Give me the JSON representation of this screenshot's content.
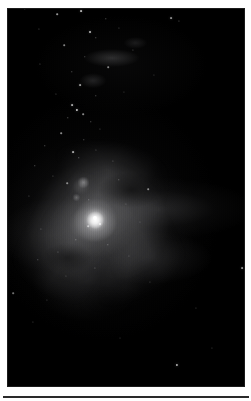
{
  "page": {
    "background_color": "#ffffff",
    "width": 251,
    "height": 401
  },
  "figure": {
    "name": "orion-nebula-plate",
    "kind": "astronomical-photograph",
    "rendering": "monochrome grayscale halftone",
    "background_color": "#000000",
    "frame": {
      "x": 8,
      "y": 9,
      "width": 236,
      "height": 377
    },
    "caption": "",
    "label": ""
  },
  "features": [
    {
      "name": "huygens-core",
      "label": "",
      "x_pct": 37,
      "y_pct": 56,
      "brightness": "peak"
    },
    {
      "name": "m43-loop",
      "label": "",
      "x_pct": 31,
      "y_pct": 47,
      "brightness": "bright"
    },
    {
      "name": "east-wing",
      "label": "",
      "x_pct": 64,
      "y_pct": 53,
      "brightness": "faint"
    },
    {
      "name": "west-wing",
      "label": "",
      "x_pct": 18,
      "y_pct": 60,
      "brightness": "faint"
    },
    {
      "name": "ngc1977-wisp",
      "label": "",
      "x_pct": 46,
      "y_pct": 13,
      "brightness": "faint"
    },
    {
      "name": "southern-skirt",
      "label": "",
      "x_pct": 34,
      "y_pct": 72,
      "brightness": "faint"
    }
  ],
  "stars": [
    {
      "x": 25,
      "y": 9,
      "r": 0.7,
      "o": 0.55
    },
    {
      "x": 57,
      "y": 14,
      "r": 0.8,
      "o": 0.6
    },
    {
      "x": 81,
      "y": 11,
      "r": 0.9,
      "o": 0.7
    },
    {
      "x": 106,
      "y": 19,
      "r": 0.7,
      "o": 0.45
    },
    {
      "x": 171,
      "y": 18,
      "r": 0.9,
      "o": 0.55
    },
    {
      "x": 179,
      "y": 21,
      "r": 0.6,
      "o": 0.4
    },
    {
      "x": 39,
      "y": 29,
      "r": 0.6,
      "o": 0.35
    },
    {
      "x": 90,
      "y": 32,
      "r": 1.0,
      "o": 0.75
    },
    {
      "x": 96,
      "y": 38,
      "r": 0.7,
      "o": 0.45
    },
    {
      "x": 119,
      "y": 28,
      "r": 0.6,
      "o": 0.35
    },
    {
      "x": 64,
      "y": 45,
      "r": 0.8,
      "o": 0.5
    },
    {
      "x": 85,
      "y": 57,
      "r": 0.7,
      "o": 0.4
    },
    {
      "x": 133,
      "y": 50,
      "r": 0.6,
      "o": 0.35
    },
    {
      "x": 40,
      "y": 64,
      "r": 0.6,
      "o": 0.35
    },
    {
      "x": 72,
      "y": 72,
      "r": 0.7,
      "o": 0.45
    },
    {
      "x": 108,
      "y": 67,
      "r": 0.8,
      "o": 0.5
    },
    {
      "x": 154,
      "y": 75,
      "r": 0.6,
      "o": 0.3
    },
    {
      "x": 80,
      "y": 85,
      "r": 0.9,
      "o": 0.6
    },
    {
      "x": 56,
      "y": 94,
      "r": 0.6,
      "o": 0.35
    },
    {
      "x": 96,
      "y": 96,
      "r": 0.7,
      "o": 0.45
    },
    {
      "x": 124,
      "y": 92,
      "r": 0.6,
      "o": 0.3
    },
    {
      "x": 72,
      "y": 105,
      "r": 0.9,
      "o": 0.65
    },
    {
      "x": 77,
      "y": 110,
      "r": 1.1,
      "o": 0.8
    },
    {
      "x": 83,
      "y": 114,
      "r": 0.8,
      "o": 0.55
    },
    {
      "x": 68,
      "y": 118,
      "r": 0.7,
      "o": 0.5
    },
    {
      "x": 91,
      "y": 122,
      "r": 0.7,
      "o": 0.45
    },
    {
      "x": 100,
      "y": 129,
      "r": 0.6,
      "o": 0.35
    },
    {
      "x": 61,
      "y": 133,
      "r": 0.8,
      "o": 0.55
    },
    {
      "x": 84,
      "y": 140,
      "r": 0.7,
      "o": 0.45
    },
    {
      "x": 45,
      "y": 146,
      "r": 0.7,
      "o": 0.45
    },
    {
      "x": 73,
      "y": 152,
      "r": 0.9,
      "o": 0.65
    },
    {
      "x": 79,
      "y": 158,
      "r": 0.7,
      "o": 0.5
    },
    {
      "x": 96,
      "y": 150,
      "r": 0.6,
      "o": 0.35
    },
    {
      "x": 113,
      "y": 161,
      "r": 0.6,
      "o": 0.35
    },
    {
      "x": 35,
      "y": 166,
      "r": 0.7,
      "o": 0.45
    },
    {
      "x": 53,
      "y": 176,
      "r": 0.6,
      "o": 0.35
    },
    {
      "x": 67,
      "y": 183,
      "r": 0.8,
      "o": 0.5
    },
    {
      "x": 119,
      "y": 180,
      "r": 0.7,
      "o": 0.4
    },
    {
      "x": 148,
      "y": 189,
      "r": 0.8,
      "o": 0.5
    },
    {
      "x": 29,
      "y": 196,
      "r": 0.6,
      "o": 0.35
    },
    {
      "x": 89,
      "y": 200,
      "r": 0.7,
      "o": 0.4
    },
    {
      "x": 126,
      "y": 204,
      "r": 0.6,
      "o": 0.3
    },
    {
      "x": 95,
      "y": 218,
      "r": 2.0,
      "o": 1.0
    },
    {
      "x": 100,
      "y": 224,
      "r": 1.0,
      "o": 0.75
    },
    {
      "x": 88,
      "y": 226,
      "r": 0.8,
      "o": 0.55
    },
    {
      "x": 41,
      "y": 229,
      "r": 0.6,
      "o": 0.35
    },
    {
      "x": 140,
      "y": 222,
      "r": 0.6,
      "o": 0.3
    },
    {
      "x": 76,
      "y": 240,
      "r": 0.7,
      "o": 0.45
    },
    {
      "x": 108,
      "y": 245,
      "r": 0.7,
      "o": 0.45
    },
    {
      "x": 58,
      "y": 252,
      "r": 0.6,
      "o": 0.35
    },
    {
      "x": 129,
      "y": 256,
      "r": 0.6,
      "o": 0.3
    },
    {
      "x": 38,
      "y": 260,
      "r": 0.7,
      "o": 0.4
    },
    {
      "x": 95,
      "y": 268,
      "r": 0.6,
      "o": 0.35
    },
    {
      "x": 242,
      "y": 268,
      "r": 0.9,
      "o": 0.55
    },
    {
      "x": 66,
      "y": 276,
      "r": 0.6,
      "o": 0.3
    },
    {
      "x": 150,
      "y": 282,
      "r": 0.6,
      "o": 0.3
    },
    {
      "x": 13,
      "y": 293,
      "r": 0.8,
      "o": 0.45
    },
    {
      "x": 47,
      "y": 300,
      "r": 0.6,
      "o": 0.3
    },
    {
      "x": 196,
      "y": 308,
      "r": 0.6,
      "o": 0.3
    },
    {
      "x": 33,
      "y": 322,
      "r": 0.6,
      "o": 0.3
    },
    {
      "x": 177,
      "y": 365,
      "r": 1.1,
      "o": 0.7
    },
    {
      "x": 212,
      "y": 348,
      "r": 0.6,
      "o": 0.3
    },
    {
      "x": 120,
      "y": 338,
      "r": 0.5,
      "o": 0.25
    }
  ],
  "rule": {
    "name": "bottom-rule",
    "color": "#2a2a2a"
  }
}
